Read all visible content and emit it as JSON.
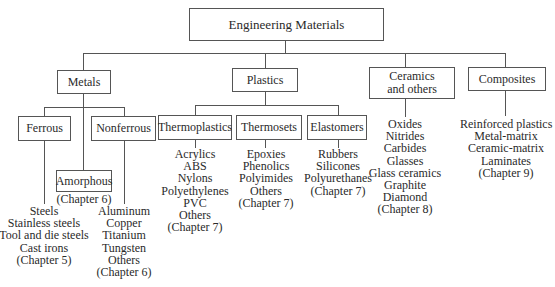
{
  "root": {
    "label": "Engineering Materials"
  },
  "categories": {
    "metals": {
      "label": "Metals",
      "children": {
        "ferrous": {
          "label": "Ferrous",
          "items": [
            "Steels",
            "Stainless steels",
            "Tool and die steels",
            "Cast irons",
            "(Chapter 5)"
          ]
        },
        "amorphous": {
          "label": "Amorphous",
          "chapter": "(Chapter 6)"
        },
        "nonferrous": {
          "label": "Nonferrous",
          "items": [
            "Aluminum",
            "Copper",
            "Titanium",
            "Tungsten",
            "Others",
            "(Chapter 6)"
          ]
        }
      }
    },
    "plastics": {
      "label": "Plastics",
      "children": {
        "thermoplastics": {
          "label": "Thermoplastics",
          "items": [
            "Acrylics",
            "ABS",
            "Nylons",
            "Polyethylenes",
            "PVC",
            "Others",
            "(Chapter 7)"
          ]
        },
        "thermosets": {
          "label": "Thermosets",
          "items": [
            "Epoxies",
            "Phenolics",
            "Polyimides",
            "Others",
            "(Chapter 7)"
          ]
        },
        "elastomers": {
          "label": "Elastomers",
          "items": [
            "Rubbers",
            "Silicones",
            "Polyurethanes",
            "(Chapter 7)"
          ]
        }
      }
    },
    "ceramics": {
      "label_line1": "Ceramics",
      "label_line2": "and others",
      "items": [
        "Oxides",
        "Nitrides",
        "Carbides",
        "Glasses",
        "Glass ceramics",
        "Graphite",
        "Diamond",
        "(Chapter 8)"
      ]
    },
    "composites": {
      "label": "Composites",
      "items": [
        "Reinforced plastics",
        "Metal-matrix",
        "Ceramic-matrix",
        "Laminates",
        "(Chapter 9)"
      ]
    }
  }
}
